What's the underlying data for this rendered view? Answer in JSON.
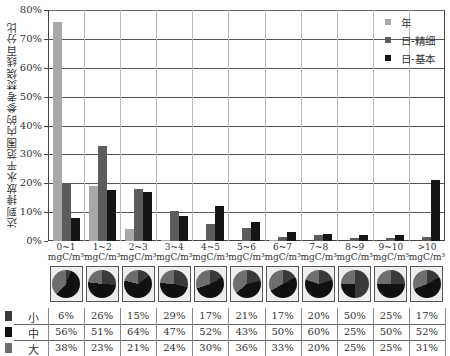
{
  "chart_data": {
    "type": "bar",
    "title": "",
    "xlabel": "",
    "ylabel": "达到排放水平范围内的参考焚烧线百分比",
    "ylim": [
      0,
      80
    ],
    "yticks": [
      "0%",
      "10%",
      "20%",
      "30%",
      "40%",
      "50%",
      "60%",
      "70%",
      "80%"
    ],
    "grid": true,
    "legend_position": "top-right",
    "categories": [
      "0~1",
      "1~2",
      "2~3",
      "3~4",
      "4~5",
      "5~6",
      "6~7",
      "7~8",
      "8~9",
      "9~10",
      ">10"
    ],
    "category_unit": "mgC/m³",
    "series": [
      {
        "name": "年",
        "color": "#a8a8a8",
        "values": [
          76,
          19,
          4,
          0.3,
          0,
          0,
          0.3,
          0,
          0,
          0,
          0
        ]
      },
      {
        "name": "日-精细",
        "color": "#5c5c5c",
        "values": [
          20,
          33,
          18,
          10.5,
          6,
          4.5,
          1.5,
          2,
          1,
          1,
          1.5
        ]
      },
      {
        "name": "日-基本",
        "color": "#151515",
        "values": [
          8,
          17.5,
          17,
          8.5,
          12,
          6.5,
          3,
          2.5,
          2,
          2,
          21
        ]
      }
    ],
    "size_table": {
      "rows": [
        {
          "name": "小",
          "color": "#3a3a3a",
          "values": [
            "6%",
            "26%",
            "15%",
            "29%",
            "17%",
            "21%",
            "17%",
            "20%",
            "50%",
            "25%",
            "17%"
          ]
        },
        {
          "name": "中",
          "color": "#111111",
          "values": [
            "56%",
            "51%",
            "64%",
            "47%",
            "52%",
            "43%",
            "50%",
            "60%",
            "25%",
            "50%",
            "52%"
          ]
        },
        {
          "name": "大",
          "color": "#6e6e6e",
          "values": [
            "38%",
            "23%",
            "21%",
            "24%",
            "30%",
            "36%",
            "33%",
            "20%",
            "25%",
            "25%",
            "31%"
          ]
        }
      ],
      "pie_fractions": [
        [
          6,
          56,
          38
        ],
        [
          26,
          51,
          23
        ],
        [
          15,
          64,
          21
        ],
        [
          29,
          47,
          24
        ],
        [
          17,
          52,
          30
        ],
        [
          21,
          43,
          36
        ],
        [
          17,
          50,
          33
        ],
        [
          20,
          60,
          20
        ],
        [
          50,
          25,
          25
        ],
        [
          25,
          50,
          25
        ],
        [
          17,
          52,
          31
        ]
      ]
    }
  },
  "legend": {
    "items": [
      {
        "label": "年",
        "color": "#a8a8a8"
      },
      {
        "label": "日-精细",
        "color": "#5c5c5c"
      },
      {
        "label": "日-基本",
        "color": "#151515"
      }
    ]
  }
}
